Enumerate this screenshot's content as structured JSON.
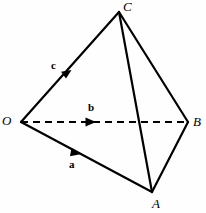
{
  "figure": {
    "kind": "tetrahedron-vector-diagram",
    "width": 206,
    "height": 213,
    "background_color": "#fefefe",
    "stroke_color": "#000000"
  },
  "vertices": [
    {
      "id": "O",
      "label": "O",
      "x": 21,
      "y": 122
    },
    {
      "id": "A",
      "label": "A",
      "x": 152,
      "y": 192
    },
    {
      "id": "B",
      "label": "B",
      "x": 188,
      "y": 122
    },
    {
      "id": "C",
      "label": "C",
      "x": 119,
      "y": 12
    }
  ],
  "edges": [
    {
      "id": "OC",
      "from": "O",
      "to": "C",
      "style": "solid",
      "x1": 21,
      "y1": 122,
      "x2": 119,
      "y2": 12
    },
    {
      "id": "OA",
      "from": "O",
      "to": "A",
      "style": "solid",
      "x1": 21,
      "y1": 122,
      "x2": 152,
      "y2": 192
    },
    {
      "id": "OB",
      "from": "O",
      "to": "B",
      "style": "dashed",
      "x1": 21,
      "y1": 122,
      "x2": 188,
      "y2": 122
    },
    {
      "id": "CB",
      "from": "C",
      "to": "B",
      "style": "solid",
      "x1": 119,
      "y1": 12,
      "x2": 188,
      "y2": 122
    },
    {
      "id": "CA",
      "from": "C",
      "to": "A",
      "style": "solid",
      "x1": 119,
      "y1": 12,
      "x2": 152,
      "y2": 192
    },
    {
      "id": "AB",
      "from": "A",
      "to": "B",
      "style": "solid",
      "x1": 152,
      "y1": 192,
      "x2": 188,
      "y2": 122
    }
  ],
  "vectors": [
    {
      "id": "a",
      "label": "a",
      "along_edge": "OA",
      "arrow_x": 80,
      "arrow_y": 153,
      "label_x": 69,
      "label_y": 159
    },
    {
      "id": "b",
      "label": "b",
      "along_edge": "OB",
      "arrow_x": 94,
      "arrow_y": 122,
      "label_x": 88,
      "label_y": 102
    },
    {
      "id": "c",
      "label": "c",
      "along_edge": "OC",
      "arrow_x": 70,
      "arrow_y": 72,
      "label_x": 51,
      "label_y": 60
    }
  ]
}
